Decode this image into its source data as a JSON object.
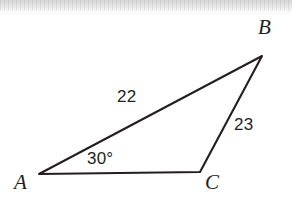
{
  "figure": {
    "type": "geometry-diagram",
    "shape": "triangle",
    "background_color": "#ffffff",
    "stroke_color": "#231f20",
    "text_color": "#231f20",
    "stroke_width": 2.1,
    "canvas": {
      "width": 292,
      "height": 205
    }
  },
  "vertices": [
    {
      "id": "A",
      "label": "A",
      "x": 39,
      "y": 174
    },
    {
      "id": "B",
      "label": "B",
      "x": 262,
      "y": 56
    },
    {
      "id": "C",
      "label": "C",
      "x": 200,
      "y": 172
    }
  ],
  "sides": [
    {
      "id": "AB",
      "from": "A",
      "to": "B",
      "length_label": "22"
    },
    {
      "id": "BC",
      "from": "B",
      "to": "C",
      "length_label": "23"
    },
    {
      "id": "AC",
      "from": "A",
      "to": "C",
      "length_label": ""
    }
  ],
  "angles": [
    {
      "at": "A",
      "label": "30°",
      "value": 30,
      "unit": "degrees"
    }
  ],
  "labels": {
    "vertex_a": "A",
    "vertex_b": "B",
    "vertex_c": "C",
    "side_ab": "22",
    "side_bc": "23",
    "angle_a": "30°"
  },
  "path": {
    "triangle_points": "39,174 262,56 200,172"
  }
}
